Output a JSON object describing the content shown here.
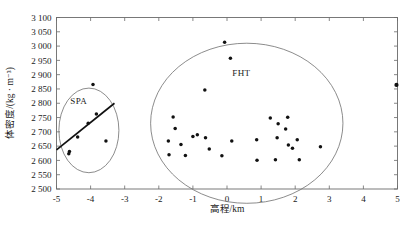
{
  "chart_data": {
    "type": "scatter",
    "title": "",
    "xlabel": "高程/km",
    "ylabel": "体密度/(kg · m⁻³)",
    "xlim": [
      -5,
      5
    ],
    "ylim": [
      2500,
      3100
    ],
    "xticks": [
      -5,
      -4,
      -3,
      -2,
      -1,
      0,
      1,
      2,
      3,
      4,
      5
    ],
    "xtick_labels": [
      "-5",
      "-4",
      "-3",
      "-2",
      "-1",
      "0",
      "1",
      "2",
      "3",
      "4",
      "5"
    ],
    "yticks": [
      2500,
      2550,
      2600,
      2650,
      2700,
      2750,
      2800,
      2850,
      2900,
      2950,
      3000,
      3050,
      3100
    ],
    "ytick_labels": [
      "2 500",
      "2 550",
      "2 600",
      "2 650",
      "2 700",
      "2 750",
      "2 800",
      "2 850",
      "2 900",
      "2 950",
      "3 000",
      "3 050",
      "3 100"
    ],
    "grid": false,
    "legend_position": "none",
    "series": [
      {
        "name": "SPA",
        "points": [
          {
            "x": -4.62,
            "y": 2631
          },
          {
            "x": -4.64,
            "y": 2623
          },
          {
            "x": -4.38,
            "y": 2682
          },
          {
            "x": -4.07,
            "y": 2730
          },
          {
            "x": -3.83,
            "y": 2762
          },
          {
            "x": -3.93,
            "y": 2866
          },
          {
            "x": -3.55,
            "y": 2668
          }
        ]
      },
      {
        "name": "FHT",
        "points": [
          {
            "x": -0.07,
            "y": 3013
          },
          {
            "x": 0.1,
            "y": 2957
          },
          {
            "x": -0.65,
            "y": 2846
          },
          {
            "x": -1.58,
            "y": 2752
          },
          {
            "x": -1.52,
            "y": 2712
          },
          {
            "x": -1.0,
            "y": 2684
          },
          {
            "x": -0.87,
            "y": 2690
          },
          {
            "x": -1.72,
            "y": 2668
          },
          {
            "x": -1.35,
            "y": 2656
          },
          {
            "x": -0.63,
            "y": 2679
          },
          {
            "x": -0.52,
            "y": 2640
          },
          {
            "x": -1.7,
            "y": 2620
          },
          {
            "x": -1.22,
            "y": 2617
          },
          {
            "x": -0.15,
            "y": 2616
          },
          {
            "x": 0.14,
            "y": 2668
          },
          {
            "x": 0.87,
            "y": 2672
          },
          {
            "x": 0.88,
            "y": 2601
          },
          {
            "x": 1.27,
            "y": 2748
          },
          {
            "x": 1.5,
            "y": 2728
          },
          {
            "x": 1.47,
            "y": 2679
          },
          {
            "x": 1.78,
            "y": 2751
          },
          {
            "x": 1.72,
            "y": 2710
          },
          {
            "x": 1.8,
            "y": 2654
          },
          {
            "x": 1.92,
            "y": 2643
          },
          {
            "x": 2.06,
            "y": 2672
          },
          {
            "x": 2.12,
            "y": 2602
          },
          {
            "x": 1.42,
            "y": 2602
          },
          {
            "x": 2.74,
            "y": 2648
          }
        ]
      },
      {
        "name": "isolated",
        "points": [
          {
            "x": 4.97,
            "y": 2864
          }
        ]
      }
    ],
    "annotations": [
      {
        "label": "SPA",
        "x": -4.35,
        "y": 2808
      },
      {
        "label": "FHT",
        "x": 0.42,
        "y": 2905
      }
    ],
    "ellipses": [
      {
        "label": "SPA",
        "cx": -4.05,
        "cy": 2705,
        "rx": 0.88,
        "ry": 148,
        "rotation": 0
      },
      {
        "label": "FHT",
        "cx": 0.58,
        "cy": 2730,
        "rx": 2.82,
        "ry": 280,
        "rotation": 0
      }
    ],
    "trend_lines": [
      {
        "label": "SPA-regression",
        "x1": -5.0,
        "y1": 2637,
        "x2": -3.3,
        "y2": 2800
      }
    ]
  },
  "style": {
    "point_color": "#111111",
    "ellipse_color": "#6f6f6f",
    "axis_color": "#6a6a6a",
    "trend_color": "#111111",
    "background": "#ffffff"
  }
}
